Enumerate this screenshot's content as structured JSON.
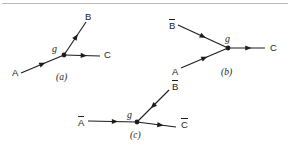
{
  "figure": {
    "background": "#ffffff",
    "line_color": "#1c1c1c",
    "rule_color": "#b9b9b9",
    "diagrams": [
      {
        "caption": "(a)",
        "coupling_label": "g",
        "vertex": {
          "x": 64,
          "y": 55
        },
        "legs": [
          {
            "name": "A",
            "bar": false,
            "label": "A",
            "label_x": 12,
            "label_y": 68,
            "from": {
              "x": 21,
              "y": 73
            },
            "to": {
              "x": 64,
              "y": 55
            },
            "arrow_at": 0.5,
            "direction": "incoming"
          },
          {
            "name": "B",
            "bar": false,
            "label": "B",
            "label_x": 85,
            "label_y": 12,
            "from": {
              "x": 64,
              "y": 55
            },
            "to": {
              "x": 86,
              "y": 22
            },
            "arrow_at": 0.55,
            "direction": "outgoing"
          },
          {
            "name": "C",
            "bar": false,
            "label": "C",
            "label_x": 104,
            "label_y": 50,
            "from": {
              "x": 64,
              "y": 55
            },
            "to": {
              "x": 100,
              "y": 56
            },
            "arrow_at": 0.55,
            "direction": "outgoing"
          }
        ],
        "caption_x": 56,
        "caption_y": 73,
        "coupling_x": 52,
        "coupling_y": 44
      },
      {
        "caption": "(b)",
        "coupling_label": "g",
        "vertex": {
          "x": 228,
          "y": 48
        },
        "legs": [
          {
            "name": "Bbar",
            "bar": true,
            "label": "B",
            "label_x": 169,
            "label_y": 19,
            "from": {
              "x": 178,
              "y": 25
            },
            "to": {
              "x": 228,
              "y": 48
            },
            "arrow_at": 0.5,
            "direction": "incoming"
          },
          {
            "name": "A",
            "bar": false,
            "label": "A",
            "label_x": 172,
            "label_y": 67,
            "from": {
              "x": 181,
              "y": 68
            },
            "to": {
              "x": 228,
              "y": 48
            },
            "arrow_at": 0.5,
            "direction": "incoming"
          },
          {
            "name": "C",
            "bar": false,
            "label": "C",
            "label_x": 270,
            "label_y": 43,
            "from": {
              "x": 228,
              "y": 48
            },
            "to": {
              "x": 265,
              "y": 48
            },
            "arrow_at": 0.55,
            "direction": "outgoing"
          }
        ],
        "caption_x": 221,
        "caption_y": 68,
        "coupling_x": 225,
        "coupling_y": 34
      },
      {
        "caption": "(c)",
        "coupling_label": "g",
        "vertex": {
          "x": 137,
          "y": 122
        },
        "legs": [
          {
            "name": "Abar",
            "bar": true,
            "label": "A",
            "label_x": 78,
            "label_y": 116,
            "from": {
              "x": 88,
              "y": 121
            },
            "to": {
              "x": 137,
              "y": 122
            },
            "arrow_at": 0.55,
            "direction": "incoming"
          },
          {
            "name": "Bbar",
            "bar": true,
            "label": "B",
            "label_x": 172,
            "label_y": 80,
            "from": {
              "x": 169,
              "y": 90
            },
            "to": {
              "x": 137,
              "y": 122
            },
            "arrow_at": 0.5,
            "direction": "incoming"
          },
          {
            "name": "Cbar",
            "bar": true,
            "label": "C",
            "label_x": 181,
            "label_y": 118,
            "from": {
              "x": 137,
              "y": 122
            },
            "to": {
              "x": 176,
              "y": 127
            },
            "arrow_at": 0.6,
            "direction": "outgoing"
          }
        ],
        "caption_x": 130,
        "caption_y": 131,
        "coupling_x": 127,
        "coupling_y": 110
      }
    ]
  }
}
